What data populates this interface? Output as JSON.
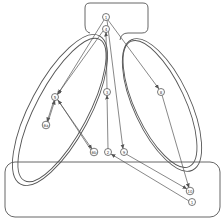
{
  "diagram": {
    "colors": {
      "stroke": "#555555",
      "background": "#ffffff"
    },
    "regions": [
      {
        "id": "top-box",
        "label": ""
      },
      {
        "id": "left-oval-outer",
        "label": ""
      },
      {
        "id": "left-oval-inner",
        "label": ""
      },
      {
        "id": "right-oval-outer",
        "label": ""
      },
      {
        "id": "right-oval-inner",
        "label": ""
      },
      {
        "id": "bottom-box",
        "label": ""
      }
    ],
    "nodes": [
      {
        "id": "n1top",
        "label": "1",
        "x": 106,
        "y": 17
      },
      {
        "id": "n4",
        "label": "4",
        "x": 106,
        "y": 29
      },
      {
        "id": "n5",
        "label": "5",
        "x": 55,
        "y": 97
      },
      {
        "id": "n6a",
        "label": "6a",
        "x": 46,
        "y": 125
      },
      {
        "id": "n3",
        "label": "3",
        "x": 107,
        "y": 92
      },
      {
        "id": "n6b",
        "label": "6b",
        "x": 94,
        "y": 152
      },
      {
        "id": "n2",
        "label": "2",
        "x": 108,
        "y": 152
      },
      {
        "id": "n9",
        "label": "9",
        "x": 124,
        "y": 152
      },
      {
        "id": "n8",
        "label": "8",
        "x": 161,
        "y": 92
      },
      {
        "id": "n10",
        "label": "10",
        "x": 190,
        "y": 191
      },
      {
        "id": "n1bot",
        "label": "1",
        "x": 192,
        "y": 202
      }
    ],
    "edges": [
      {
        "from": "n1top",
        "to": "n5"
      },
      {
        "from": "n4",
        "to": "n5"
      },
      {
        "from": "n1top",
        "to": "n8"
      },
      {
        "from": "n1top",
        "to": "n9"
      },
      {
        "from": "n3",
        "to": "n4"
      },
      {
        "from": "n2",
        "to": "n3"
      },
      {
        "from": "n5",
        "to": "n6a"
      },
      {
        "from": "n6a",
        "to": "n5"
      },
      {
        "from": "n5",
        "to": "n6b"
      },
      {
        "from": "n6b",
        "to": "n5"
      },
      {
        "from": "n8",
        "to": "n10"
      },
      {
        "from": "n9",
        "to": "n10"
      },
      {
        "from": "n1bot",
        "to": "n2"
      }
    ]
  }
}
